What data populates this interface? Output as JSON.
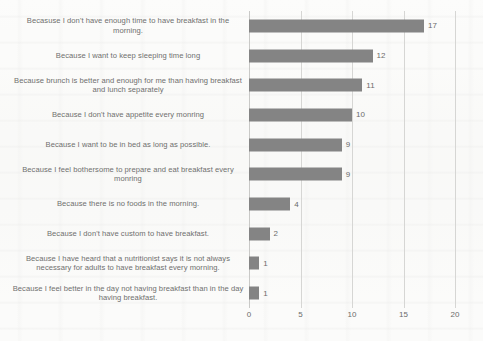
{
  "chart_data": {
    "type": "bar",
    "orientation": "horizontal",
    "title": "",
    "xlabel": "",
    "ylabel": "",
    "xlim": [
      0,
      20
    ],
    "xticks": [
      0,
      5,
      10,
      15,
      20
    ],
    "grid": true,
    "legend": false,
    "bar_color": "#848484",
    "categories": [
      "Becasuse I don't have enough time to have breakfast in the morning.",
      "Because I want to keep sleeping time long",
      "Because brunch is better and enough for me than having breakfast and lunch separately",
      "Because I don't have appetite every monring",
      "Because I want to be in bed as long as possible.",
      "Because I feel bothersome to prepare and eat breakfast every monring",
      "Because there is no foods in the morning.",
      "Because I don't have custom to have breakfast.",
      "Because I have heard that a nutritionist says it is not always necessary for adults to have breakfast every morning.",
      "Because I feel better in the day not having breakfast than in the day having breakfast."
    ],
    "values": [
      17,
      12,
      11,
      10,
      9,
      9,
      4,
      2,
      1,
      1
    ],
    "value_labels": [
      "17",
      "12",
      "11",
      "10",
      "9",
      "9",
      "4",
      "2",
      "1",
      "1"
    ]
  }
}
